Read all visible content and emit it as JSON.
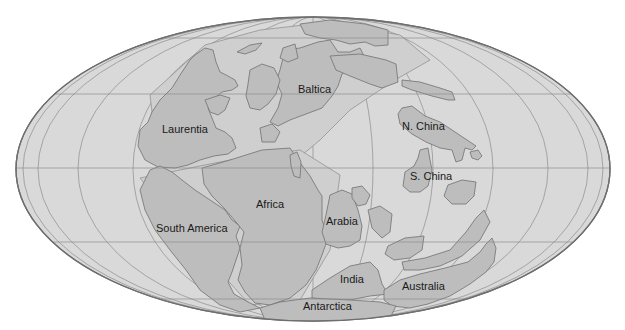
{
  "map": {
    "projection": "Mollweide",
    "colors": {
      "background": "#ffffff",
      "ocean": "#d9d9d9",
      "land": "#bdbdbd",
      "shelf": "#cfcfcf",
      "outline": "#6e6e6e",
      "grid": "#8c8c8c",
      "label": "#1a1a1a"
    },
    "labels": {
      "laurentia": "Laurentia",
      "baltica": "Baltica",
      "n_china": "N. China",
      "s_china": "S. China",
      "africa": "Africa",
      "south_america": "South America",
      "arabia": "Arabia",
      "india": "India",
      "australia": "Australia",
      "antarctica": "Antarctica"
    }
  }
}
